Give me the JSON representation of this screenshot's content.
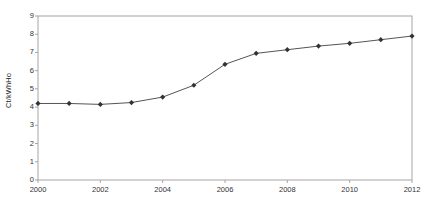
{
  "chart_data": {
    "type": "line",
    "title": "",
    "subtitle": "",
    "xlabel": "",
    "ylabel": "Ct/kWhHo",
    "x": [
      2000,
      2001,
      2002,
      2003,
      2004,
      2005,
      2006,
      2007,
      2008,
      2009,
      2010,
      2011,
      2012
    ],
    "values": [
      4.2,
      4.2,
      4.15,
      4.25,
      4.55,
      5.2,
      6.35,
      6.95,
      7.15,
      7.35,
      7.5,
      7.7,
      7.9
    ],
    "series": [
      {
        "name": "Ct/kWhHo",
        "values": [
          4.2,
          4.2,
          4.15,
          4.25,
          4.55,
          5.2,
          6.35,
          6.95,
          7.15,
          7.35,
          7.5,
          7.7,
          7.9
        ]
      }
    ],
    "xlim": [
      2000,
      2012
    ],
    "ylim": [
      0,
      9
    ],
    "y_ticks": [
      9,
      8,
      7,
      6,
      5,
      4,
      3,
      2,
      1,
      0
    ],
    "x_ticks": [
      2000,
      2002,
      2004,
      2006,
      2008,
      2010,
      2012
    ],
    "x_tick_labels": [
      "2000",
      "2002",
      "2004",
      "2006",
      "2008",
      "2010",
      "2012"
    ],
    "y_tick_labels": [
      "9",
      "8",
      "7",
      "6",
      "5",
      "4",
      "3",
      "2",
      "1",
      "0"
    ],
    "grid": false,
    "legend": false,
    "legend_position": "none",
    "marker": "diamond",
    "line_color": "#555555",
    "marker_color": "#333333",
    "axis_color": "#a6a6a6",
    "background_color": "#ffffff"
  }
}
